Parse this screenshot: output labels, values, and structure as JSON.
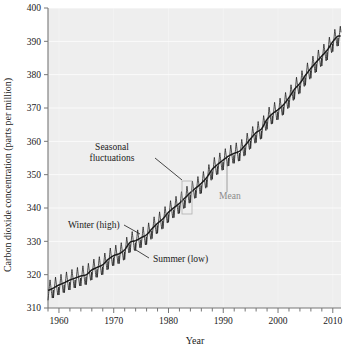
{
  "chart_data": {
    "type": "line",
    "title": "",
    "subtitle": "",
    "xlabel": "Year",
    "ylabel": "Carbon dioxide concentration (parts per million)",
    "xlim": [
      1958,
      2011.5
    ],
    "ylim": [
      310,
      400
    ],
    "xticks": [
      1960,
      1970,
      1980,
      1990,
      2000,
      2010
    ],
    "xtick_labels": [
      "1960",
      "1970",
      "1980",
      "1990",
      "2000",
      "2010"
    ],
    "xminor_step": 2,
    "yticks": [
      310,
      320,
      330,
      340,
      350,
      360,
      370,
      380,
      390,
      400
    ],
    "ytick_labels": [
      "310",
      "320",
      "330",
      "340",
      "350",
      "360",
      "370",
      "380",
      "390",
      "400"
    ],
    "grid": true,
    "grid_color": "#ffffff",
    "background_color": "#eeeeee",
    "line_color": "#1a1a1a",
    "legend": "none",
    "seasonal_amplitude_ppm": 6.0,
    "series": [
      {
        "name": "Mean",
        "x": [
          1958,
          1959,
          1960,
          1961,
          1962,
          1963,
          1964,
          1965,
          1966,
          1967,
          1968,
          1969,
          1970,
          1971,
          1972,
          1973,
          1974,
          1975,
          1976,
          1977,
          1978,
          1979,
          1980,
          1981,
          1982,
          1983,
          1984,
          1985,
          1986,
          1987,
          1988,
          1989,
          1990,
          1991,
          1992,
          1993,
          1994,
          1995,
          1996,
          1997,
          1998,
          1999,
          2000,
          2001,
          2002,
          2003,
          2004,
          2005,
          2006,
          2007,
          2008,
          2009,
          2010,
          2011
        ],
        "values": [
          315.3,
          316.0,
          316.9,
          317.6,
          318.4,
          319.0,
          319.6,
          320.0,
          321.4,
          322.2,
          323.0,
          324.6,
          325.7,
          326.3,
          327.5,
          329.7,
          330.2,
          331.1,
          332.0,
          333.8,
          335.4,
          336.8,
          338.7,
          340.1,
          341.4,
          343.0,
          344.6,
          346.0,
          347.4,
          349.2,
          351.6,
          353.1,
          354.4,
          355.6,
          356.4,
          357.1,
          358.8,
          360.8,
          362.6,
          363.8,
          366.6,
          368.3,
          369.5,
          371.0,
          373.1,
          375.6,
          377.4,
          379.8,
          381.9,
          383.8,
          385.6,
          387.4,
          389.9,
          391.6
        ]
      }
    ],
    "annotations": [
      {
        "name": "seasonal-fluctuations",
        "text_line1": "Seasonal",
        "text_line2": "fluctuations",
        "color": "#1a1a1a",
        "text_x": 112,
        "text_y": 150,
        "leader_from_x": 155,
        "leader_from_y": 158,
        "leader_to_x": 182,
        "leader_to_y": 180
      },
      {
        "name": "mean",
        "text_line1": "Mean",
        "text_line2": "",
        "color": "#8a8a8a",
        "text_x": 219,
        "text_y": 199,
        "leader_from_x": 227,
        "leader_from_y": 192,
        "leader_to_x": 227,
        "leader_to_y": 163
      },
      {
        "name": "winter-high",
        "text_line1": "Winter (high)",
        "text_line2": "",
        "color": "#1a1a1a",
        "text_x": 68,
        "text_y": 228,
        "leader_from_x": 124,
        "leader_from_y": 225,
        "leader_to_x": 140,
        "leader_to_y": 234
      },
      {
        "name": "summer-low",
        "text_line1": "Summer (low)",
        "text_line2": "",
        "color": "#1a1a1a",
        "text_x": 153,
        "text_y": 262,
        "leader_from_x": 149,
        "leader_from_y": 258,
        "leader_to_x": 136,
        "leader_to_y": 250
      }
    ],
    "highlight_box": {
      "name": "seasonal-cycle-box",
      "x": 182,
      "y": 181,
      "width": 10,
      "height": 33,
      "stroke": "#b0b0b0"
    }
  }
}
